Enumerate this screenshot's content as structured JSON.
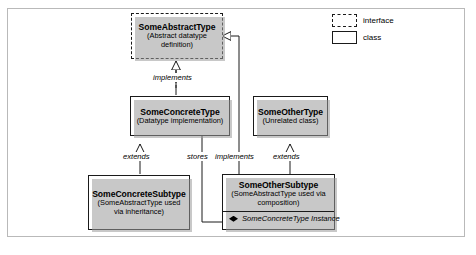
{
  "diagram": {
    "nodes": [
      {
        "id": "some-abstract-type",
        "name": "SomeAbstractType",
        "subtitle": "(Abstract datatype definition)",
        "kind": "interface"
      },
      {
        "id": "some-concrete-type",
        "name": "SomeConcreteType",
        "subtitle": "(Datatype implementation)",
        "kind": "class"
      },
      {
        "id": "some-other-type",
        "name": "SomeOtherType",
        "subtitle": "(Unrelated class)",
        "kind": "class"
      },
      {
        "id": "some-concrete-subtype",
        "name": "SomeConcreteSubtype",
        "subtitle": "(SomeAbstractType used via inheritance)",
        "kind": "class"
      },
      {
        "id": "some-other-subtype",
        "name": "SomeOtherSubtype",
        "subtitle": "(SomeAbstractType used via composition)",
        "kind": "class",
        "attribute": "SomeConcreteType Instance"
      }
    ],
    "edges": [
      {
        "id": "implements-top",
        "label": "implements",
        "from": "some-concrete-type",
        "to": "some-abstract-type",
        "style": "dashed",
        "arrow": "hollow-triangle"
      },
      {
        "id": "extends-left",
        "label": "extends",
        "from": "some-concrete-subtype",
        "to": "some-concrete-type",
        "style": "solid",
        "arrow": "hollow-triangle"
      },
      {
        "id": "stores",
        "label": "stores",
        "from": "some-other-subtype",
        "to": "some-concrete-type",
        "style": "solid",
        "arrow": "filled-diamond"
      },
      {
        "id": "implements-right",
        "label": "implements",
        "from": "some-other-subtype",
        "to": "some-abstract-type",
        "style": "solid",
        "arrow": "hollow-triangle"
      },
      {
        "id": "extends-right",
        "label": "extends",
        "from": "some-other-subtype",
        "to": "some-other-type",
        "style": "solid",
        "arrow": "hollow-triangle"
      }
    ]
  },
  "legend": {
    "items": [
      {
        "id": "interface",
        "label": "interface",
        "swatch": "dashed"
      },
      {
        "id": "class",
        "label": "class",
        "swatch": "solid"
      }
    ]
  },
  "colors": {
    "line": "#1a1a1a",
    "frame": "#b9b9b9",
    "shadow": "#9a9a9a",
    "background": "#ffffff"
  }
}
